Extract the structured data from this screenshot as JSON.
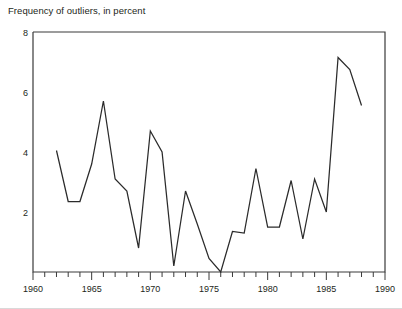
{
  "chart_data": {
    "type": "line",
    "title": "Frequency of outliers, in percent",
    "xlabel": "",
    "ylabel": "",
    "xlim": [
      1960,
      1990
    ],
    "ylim": [
      0,
      8
    ],
    "grid": false,
    "legend": null,
    "x_ticks_major": [
      1960,
      1965,
      1970,
      1975,
      1980,
      1985,
      1990
    ],
    "x_tick_labels": [
      "1960",
      "1965",
      "1970",
      "1975",
      "1980",
      "1985",
      "1990"
    ],
    "x_ticks_minor_step": 1,
    "y_ticks": [
      0,
      2,
      4,
      6,
      8
    ],
    "y_tick_labels": [
      "",
      "2",
      "4",
      "6",
      "8"
    ],
    "series": [
      {
        "name": "Frequency of outliers",
        "x": [
          1962,
          1963,
          1964,
          1965,
          1966,
          1967,
          1968,
          1969,
          1970,
          1971,
          1972,
          1973,
          1974,
          1975,
          1976,
          1977,
          1978,
          1979,
          1980,
          1981,
          1982,
          1983,
          1984,
          1985,
          1986,
          1987,
          1988
        ],
        "values": [
          4.05,
          2.35,
          2.35,
          3.6,
          5.7,
          3.1,
          2.7,
          0.8,
          4.7,
          4.0,
          0.2,
          2.7,
          1.6,
          0.45,
          0.0,
          1.35,
          1.3,
          3.45,
          1.5,
          1.5,
          3.05,
          1.1,
          3.1,
          2.0,
          7.15,
          6.75,
          5.55
        ]
      }
    ]
  },
  "axis": {
    "y_max_label": "8",
    "y_6_label": "6",
    "y_4_label": "4",
    "y_2_label": "2",
    "x_1960": "1960",
    "x_1965": "1965",
    "x_1970": "1970",
    "x_1975": "1975",
    "x_1980": "1980",
    "x_1985": "1985",
    "x_1990": "1990"
  }
}
